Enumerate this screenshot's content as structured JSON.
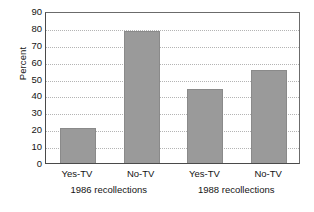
{
  "chart_data": {
    "type": "bar",
    "title": "",
    "xlabel": "",
    "ylabel": "Percent",
    "ylim": [
      0,
      90
    ],
    "ytick_step": 10,
    "yticks": [
      0,
      10,
      20,
      30,
      40,
      50,
      60,
      70,
      80,
      90
    ],
    "ytick_labels": [
      "0",
      "10",
      "20",
      "30",
      "40",
      "50",
      "60",
      "70",
      "80",
      "90"
    ],
    "grid": true,
    "grid_style": "dotted-horizontal",
    "legend": null,
    "categories": [
      "Yes-TV",
      "No-TV",
      "Yes-TV",
      "No-TV"
    ],
    "values": [
      21,
      78,
      44,
      55
    ],
    "bars": [
      {
        "label": "Yes-TV",
        "group": "1986 recollections",
        "value": 21
      },
      {
        "label": "No-TV",
        "group": "1986 recollections",
        "value": 78
      },
      {
        "label": "Yes-TV",
        "group": "1988 recollections",
        "value": 44
      },
      {
        "label": "No-TV",
        "group": "1988 recollections",
        "value": 55
      }
    ],
    "groups": [
      "1986 recollections",
      "1988 recollections"
    ],
    "bar_color": "#9a9a9a",
    "bar_edge_color": "#8a8a8a",
    "axis_color": "#4a4a4a",
    "grid_color": "#b4b4b4",
    "text_color": "#141414",
    "background": "#ffffff"
  }
}
